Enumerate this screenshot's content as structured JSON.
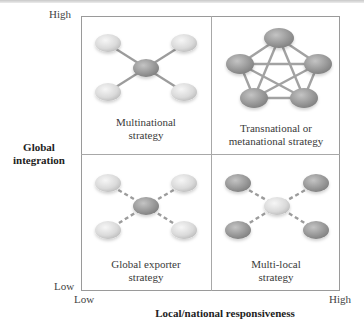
{
  "axes": {
    "y": {
      "label_line1": "Global",
      "label_line2": "integration",
      "high": "High",
      "low": "Low"
    },
    "x": {
      "label": "Local/national responsiveness",
      "low": "Low",
      "high": "High"
    }
  },
  "quadrants": [
    {
      "position": "top-left",
      "label_line1": "Multinational",
      "label_line2": "strategy",
      "network": "hub-and-spoke",
      "center_node_color": "#9a9a9a",
      "outer_node_color": "#d8d8d8",
      "link_style": "solid"
    },
    {
      "position": "top-right",
      "label_line1": "Transnational or",
      "label_line2": "metanational strategy",
      "network": "fully-connected-pentagon",
      "node_color": "#9a9a9a",
      "link_style": "solid"
    },
    {
      "position": "bottom-left",
      "label_line1": "Global exporter",
      "label_line2": "strategy",
      "network": "hub-and-spoke",
      "center_node_color": "#9a9a9a",
      "outer_node_color": "#d8d8d8",
      "link_style": "dashed"
    },
    {
      "position": "bottom-right",
      "label_line1": "Multi-local",
      "label_line2": "strategy",
      "network": "hub-and-spoke",
      "center_node_color": "#dcdcdc",
      "outer_node_color": "#9a9a9a",
      "link_style": "dashed"
    }
  ]
}
